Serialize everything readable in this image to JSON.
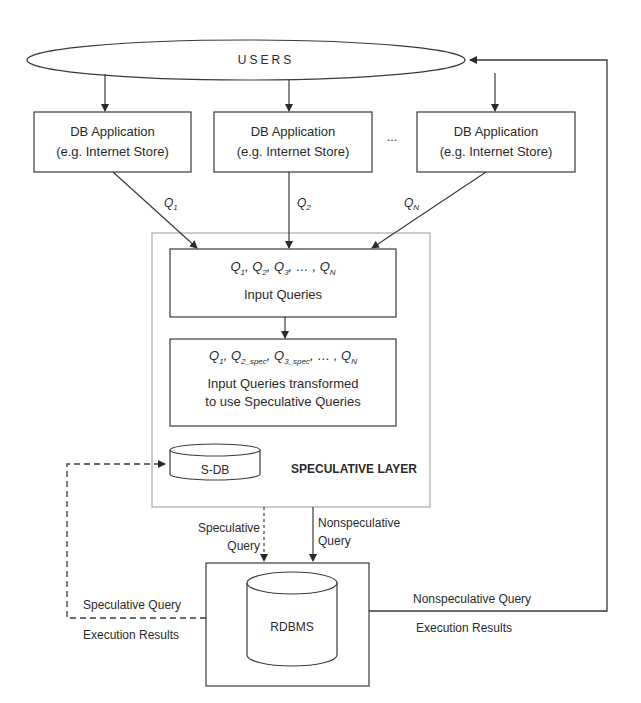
{
  "users": {
    "label": "USERS"
  },
  "apps": [
    {
      "line1": "DB Application",
      "line2": "(e.g. Internet Store)"
    },
    {
      "line1": "DB Application",
      "line2": "(e.g. Internet Store)"
    },
    {
      "line1": "DB Application",
      "line2": "(e.g. Internet Store)"
    }
  ],
  "ellipsis": "...",
  "query_labels": {
    "q1": "Q",
    "q1_sub": "1",
    "q2": "Q",
    "q2_sub": "2",
    "qn": "Q",
    "qn_sub": "N"
  },
  "input_box": {
    "queries_line": "Q1, Q2, Q3, ... , QN",
    "label": "Input Queries"
  },
  "transformed_box": {
    "queries_line": "Q1, Q2_spec, Q3_spec, ... , QN",
    "line1": "Input Queries transformed",
    "line2": "to use Speculative Queries"
  },
  "sdb": {
    "label": "S-DB"
  },
  "speculative_layer": {
    "label": "SPECULATIVE LAYER"
  },
  "edges": {
    "speculative_query": {
      "line1": "Speculative",
      "line2": "Query"
    },
    "nonspeculative_query": {
      "line1": "Nonspeculative",
      "line2": "Query"
    },
    "spec_results": {
      "line1": "Speculative Query",
      "line2": "Execution Results"
    },
    "nonspec_results": {
      "line1": "Nonspeculative Query",
      "line2": "Execution Results"
    }
  },
  "rdbms": {
    "label": "RDBMS"
  },
  "colors": {
    "line": "#3a3a3a",
    "layer_border": "#9a9a9a",
    "background": "#ffffff"
  }
}
